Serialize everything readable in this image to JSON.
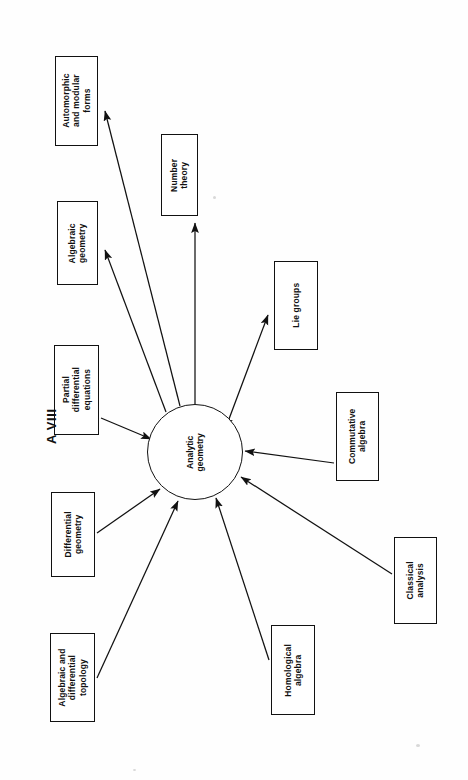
{
  "figure": {
    "tag": "A VIII",
    "orientation_degrees": -90,
    "background_color": "#fefefe",
    "stroke_color": "#111111"
  },
  "hub": {
    "id": "analytic-geometry",
    "label": "Analytic\ngeometry",
    "shape": "circle",
    "cx": 195,
    "cy": 452,
    "r": 48
  },
  "nodes": [
    {
      "id": "automorphic-and-modular-forms",
      "label": "Automorphic\nand modular\nforms",
      "x": 55,
      "y": 56,
      "w": 43,
      "h": 90,
      "edge_direction": "from-hub"
    },
    {
      "id": "number-theory",
      "label": "Number\ntheory",
      "x": 161,
      "y": 134,
      "w": 37,
      "h": 82,
      "edge_direction": "from-hub"
    },
    {
      "id": "algebraic-geometry",
      "label": "Algebraic\ngeometry",
      "x": 57,
      "y": 201,
      "w": 41,
      "h": 84,
      "edge_direction": "from-hub"
    },
    {
      "id": "lie-groups",
      "label": "Lie groups",
      "x": 274,
      "y": 261,
      "w": 44,
      "h": 89,
      "edge_direction": "from-hub"
    },
    {
      "id": "partial-differential-equations",
      "label": "Partial\ndifferential\nequations",
      "x": 54,
      "y": 345,
      "w": 45,
      "h": 90,
      "edge_direction": "to-hub"
    },
    {
      "id": "commutative-algebra",
      "label": "Commutative\nalgebra",
      "x": 336,
      "y": 392,
      "w": 43,
      "h": 89,
      "edge_direction": "to-hub"
    },
    {
      "id": "differential-geometry",
      "label": "Differential\ngeometry",
      "x": 51,
      "y": 492,
      "w": 44,
      "h": 85,
      "edge_direction": "to-hub"
    },
    {
      "id": "classical-analysis",
      "label": "Classical\nanalysis",
      "x": 394,
      "y": 537,
      "w": 43,
      "h": 87,
      "edge_direction": "to-hub"
    },
    {
      "id": "homological-algebra",
      "label": "Homological\nalgebra",
      "x": 271,
      "y": 625,
      "w": 44,
      "h": 90,
      "edge_direction": "to-hub"
    },
    {
      "id": "algebraic-and-differential-topology",
      "label": "Algebraic and\ndifferential\ntopology",
      "x": 50,
      "y": 633,
      "w": 45,
      "h": 89,
      "edge_direction": "to-hub"
    }
  ],
  "edges": [
    {
      "id": "edge-hub-to-automorphic",
      "from": "analytic-geometry",
      "to": "automorphic-and-modular-forms",
      "x1": 180,
      "y1": 406,
      "x2": 105,
      "y2": 111,
      "arrow_at": "end"
    },
    {
      "id": "edge-hub-to-algebraic-geometry",
      "from": "analytic-geometry",
      "to": "algebraic-geometry",
      "x1": 166,
      "y1": 412,
      "x2": 105,
      "y2": 250,
      "arrow_at": "end"
    },
    {
      "id": "edge-hub-to-number-theory",
      "from": "analytic-geometry",
      "to": "number-theory",
      "x1": 195,
      "y1": 404,
      "x2": 195,
      "y2": 223,
      "arrow_at": "end"
    },
    {
      "id": "edge-hub-to-lie-groups",
      "from": "analytic-geometry",
      "to": "lie-groups",
      "x1": 229,
      "y1": 419,
      "x2": 268,
      "y2": 315,
      "arrow_at": "both"
    },
    {
      "id": "edge-pde-to-hub",
      "from": "partial-differential-equations",
      "to": "analytic-geometry",
      "x1": 101,
      "y1": 418,
      "x2": 151,
      "y2": 439,
      "arrow_at": "end"
    },
    {
      "id": "edge-commutative-to-hub",
      "from": "commutative-algebra",
      "to": "analytic-geometry",
      "x1": 334,
      "y1": 463,
      "x2": 245,
      "y2": 451,
      "arrow_at": "end"
    },
    {
      "id": "edge-differential-geometry-to-hub",
      "from": "differential-geometry",
      "to": "analytic-geometry",
      "x1": 97,
      "y1": 533,
      "x2": 160,
      "y2": 489,
      "arrow_at": "end"
    },
    {
      "id": "edge-classical-analysis-to-hub",
      "from": "classical-analysis",
      "to": "analytic-geometry",
      "x1": 392,
      "y1": 574,
      "x2": 241,
      "y2": 477,
      "arrow_at": "end"
    },
    {
      "id": "edge-homological-to-hub",
      "from": "homological-algebra",
      "to": "analytic-geometry",
      "x1": 269,
      "y1": 660,
      "x2": 216,
      "y2": 498,
      "arrow_at": "end"
    },
    {
      "id": "edge-topology-to-hub",
      "from": "algebraic-and-differential-topology",
      "to": "analytic-geometry",
      "x1": 97,
      "y1": 678,
      "x2": 178,
      "y2": 501,
      "arrow_at": "end"
    }
  ],
  "chart_data": {
    "type": "diagram",
    "title": "A VIII",
    "center": "Analytic geometry",
    "related_fields": [
      "Automorphic and modular forms",
      "Number theory",
      "Algebraic geometry",
      "Lie groups",
      "Partial differential equations",
      "Commutative algebra",
      "Differential geometry",
      "Classical analysis",
      "Homological algebra",
      "Algebraic and differential topology"
    ]
  }
}
